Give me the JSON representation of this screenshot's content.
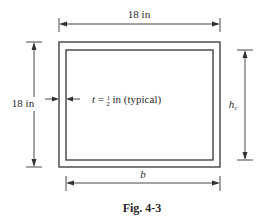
{
  "figure": {
    "caption": "Fig. 4-3",
    "labels": {
      "top_width": "18 in",
      "left_height": "18 in",
      "thickness_prefix": "t",
      "thickness_eq": " = ",
      "thickness_frac_num": "1",
      "thickness_frac_den": "2",
      "thickness_suffix": " in (typical)",
      "inner_height": "h",
      "inner_height_sub": "c",
      "inner_width": "b"
    }
  }
}
